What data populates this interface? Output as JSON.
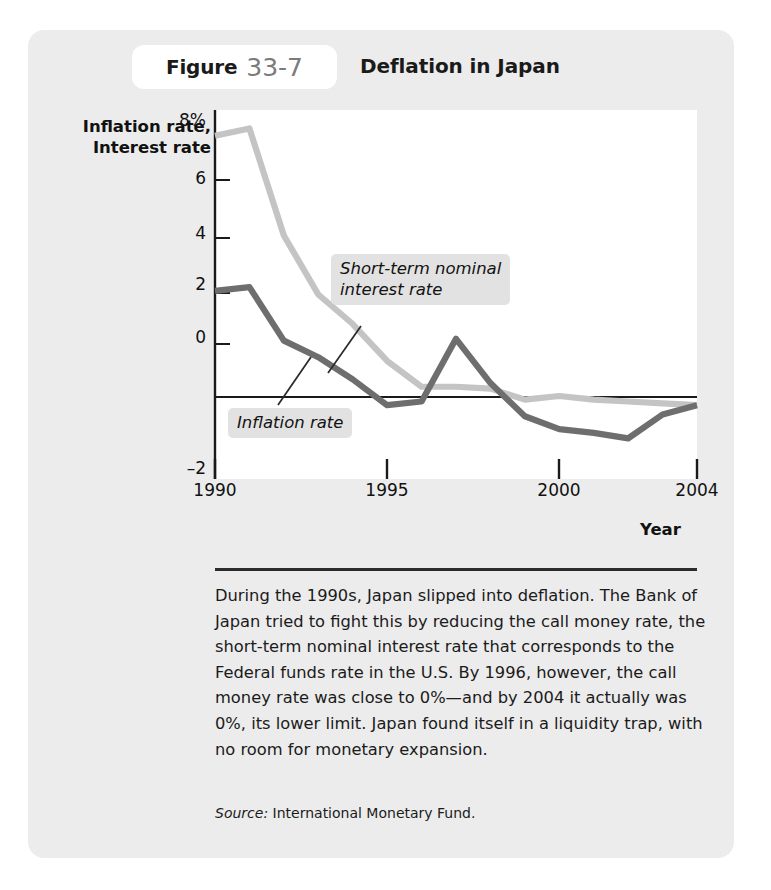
{
  "header": {
    "figure_word": "Figure",
    "figure_number": "33-7",
    "title": "Deflation in Japan"
  },
  "axes": {
    "y_title": "Inflation rate,\nInterest rate",
    "x_title": "Year",
    "y_ticks": [
      "8%",
      "6",
      "4",
      "2",
      "0",
      "–2"
    ],
    "x_ticks": [
      "1990",
      "1995",
      "2000",
      "2004"
    ]
  },
  "series_labels": {
    "interest": "Short-term nominal\ninterest rate",
    "inflation": "Inflation rate"
  },
  "caption": {
    "body": "During the 1990s, Japan slipped into deflation. The Bank of Japan tried to fight this by reducing the call money rate, the short-term nominal interest rate that corresponds to the Federal funds rate in the U.S. By 1996, however, the call money rate was close to 0%—and by 2004 it actually was 0%, its lower limit. Japan found itself in a liquidity trap, with no room for monetary expansion.",
    "source_label": "Source:",
    "source_text": "International Monetary Fund."
  },
  "colors": {
    "card_background": "#ececec",
    "plot_background": "#ffffff",
    "interest_line": "#c4c4c4",
    "inflation_line": "#6e6e6e",
    "axis": "#1a1a1a",
    "label_chip": "#e2e2e2"
  },
  "chart_data": {
    "type": "line",
    "title": "Deflation in Japan",
    "xlabel": "Year",
    "ylabel": "Inflation rate, Interest rate",
    "xlim": [
      1990,
      2004
    ],
    "ylim": [
      -2,
      8
    ],
    "grid": false,
    "legend": "annotations on plot",
    "x": [
      1990,
      1991,
      1992,
      1993,
      1994,
      1995,
      1996,
      1997,
      1998,
      1999,
      2000,
      2001,
      2002,
      2003,
      2004
    ],
    "series": [
      {
        "name": "Short-term nominal interest rate",
        "color": "#c4c4c4",
        "values": [
          7.3,
          7.5,
          4.6,
          3.0,
          2.2,
          1.2,
          0.5,
          0.5,
          0.45,
          0.15,
          0.25,
          0.15,
          0.1,
          0.05,
          0.0
        ]
      },
      {
        "name": "Inflation rate",
        "color": "#6e6e6e",
        "values": [
          3.1,
          3.2,
          1.75,
          1.3,
          0.7,
          0.0,
          0.1,
          1.8,
          0.6,
          -0.3,
          -0.65,
          -0.75,
          -0.9,
          -0.25,
          0.0
        ]
      }
    ]
  }
}
